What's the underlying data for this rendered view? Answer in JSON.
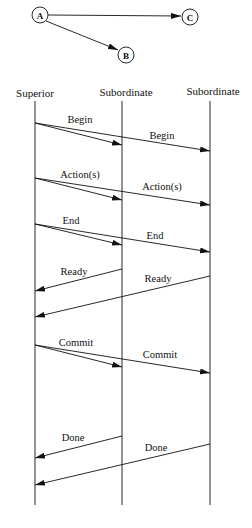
{
  "graph": {
    "nodes": [
      {
        "id": "A",
        "label": "A"
      },
      {
        "id": "B",
        "label": "B"
      },
      {
        "id": "C",
        "label": "C"
      }
    ],
    "edges": [
      {
        "from": "A",
        "to": "C"
      },
      {
        "from": "A",
        "to": "B"
      }
    ]
  },
  "sequence": {
    "participants": [
      {
        "label": "Superior"
      },
      {
        "label": "Subordinate"
      },
      {
        "label": "Subordinate"
      }
    ],
    "messages": [
      {
        "label": "Begin",
        "label2": "Begin",
        "from": "Superior",
        "to": [
          "Subordinate",
          "Subordinate"
        ]
      },
      {
        "label": "Action(s)",
        "label2": "Action(s)",
        "from": "Superior",
        "to": [
          "Subordinate",
          "Subordinate"
        ]
      },
      {
        "label": "End",
        "label2": "End",
        "from": "Superior",
        "to": [
          "Subordinate",
          "Subordinate"
        ]
      },
      {
        "label": "Ready",
        "label2": "Ready",
        "from": [
          "Subordinate",
          "Subordinate"
        ],
        "to": "Superior"
      },
      {
        "label": "Commit",
        "label2": "Commit",
        "from": "Superior",
        "to": [
          "Subordinate",
          "Subordinate"
        ]
      },
      {
        "label": "Done",
        "label2": "Done",
        "from": [
          "Subordinate",
          "Subordinate"
        ],
        "to": "Superior"
      }
    ]
  },
  "colors": {
    "line": "#111111",
    "background": "#ffffff"
  }
}
